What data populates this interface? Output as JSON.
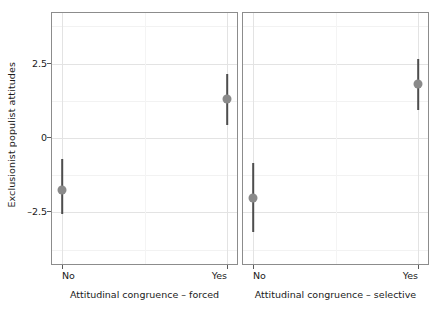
{
  "chart_data": {
    "type": "scatter",
    "title": "",
    "subtitle": "",
    "ylabel": "Exclusionist populist attitudes",
    "xlabel": "",
    "ylim": [
      -4.3,
      4.2
    ],
    "yticks": [
      2.5,
      0,
      -2.5
    ],
    "ytick_labels": [
      "2.5",
      "0",
      "–2.5"
    ],
    "grid": true,
    "legend": null,
    "legend_position": "none",
    "marker_color": "#8a8a8a",
    "errorbar_color": "#4d4d4d",
    "panel_border_color": "#8c8c8c",
    "gridline_color": "#e3e3e3",
    "panels": [
      {
        "panel_label": "",
        "xlabel": "Attitudinal congruence – forced",
        "categories": [
          "No",
          "Yes"
        ],
        "points": [
          {
            "category": "No",
            "estimate": -1.75,
            "ci_low": -2.55,
            "ci_high": -0.7
          },
          {
            "category": "Yes",
            "estimate": 1.3,
            "ci_low": 0.45,
            "ci_high": 2.15
          }
        ]
      },
      {
        "panel_label": "",
        "xlabel": "Attitudinal congruence – selective",
        "categories": [
          "No",
          "Yes"
        ],
        "points": [
          {
            "category": "No",
            "estimate": -2.0,
            "ci_low": -3.15,
            "ci_high": -0.85
          },
          {
            "category": "Yes",
            "estimate": 1.8,
            "ci_low": 0.95,
            "ci_high": 2.65
          }
        ]
      }
    ]
  }
}
